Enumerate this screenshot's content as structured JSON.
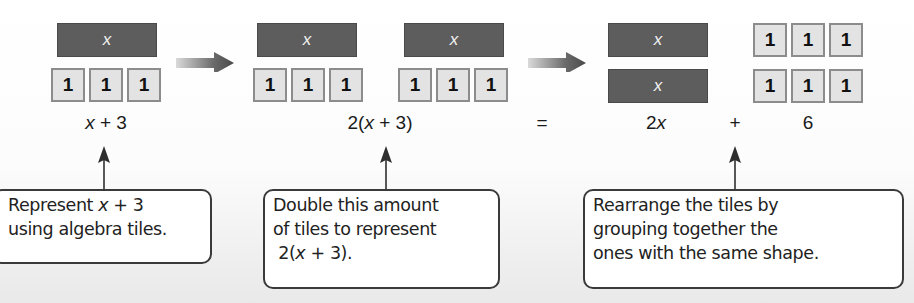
{
  "tile_labels": {
    "x": "x",
    "one": "1"
  },
  "steps": [
    {
      "expression": {
        "pre": "",
        "var": "x",
        "post": " + 3"
      },
      "callout_lines": [
        {
          "pre": "Represent ",
          "var": "x",
          "post": " + 3"
        },
        {
          "pre": "using algebra tiles.",
          "var": "",
          "post": ""
        }
      ]
    },
    {
      "expression": {
        "pre": "2(",
        "var": "x",
        "post": " + 3)"
      },
      "callout_lines": [
        {
          "pre": "Double this amount",
          "var": "",
          "post": ""
        },
        {
          "pre": "of tiles to represent",
          "var": "",
          "post": ""
        },
        {
          "pre": " 2(",
          "var": "x",
          "post": " + 3)."
        }
      ]
    },
    {
      "equals": "=",
      "expression_x": {
        "pre": "2",
        "var": "x",
        "post": ""
      },
      "plus": "+",
      "expression_const": "6",
      "callout_lines": [
        {
          "pre": "Rearrange the tiles by",
          "var": "",
          "post": ""
        },
        {
          "pre": "grouping together the",
          "var": "",
          "post": ""
        },
        {
          "pre": "ones with the same shape.",
          "var": "",
          "post": ""
        }
      ]
    }
  ],
  "colors": {
    "x_tile": "#5d5d5d",
    "one_tile": "#e3e3e3",
    "one_tile_border": "#8c8c8c",
    "arrow_dark": "#4d4d4d",
    "arrow_light": "#d9d9d9"
  }
}
